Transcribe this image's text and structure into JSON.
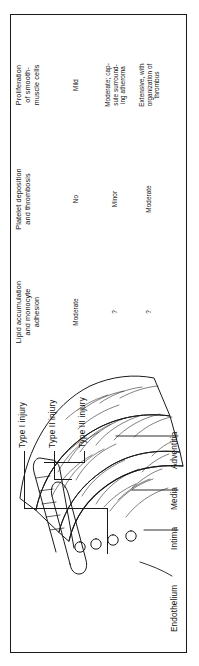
{
  "figure": {
    "title_present": false,
    "orientation": "rotated-90-ccw",
    "line_color": "#1a1a1a",
    "background": "#ffffff"
  },
  "table": {
    "columns": [
      {
        "id": "lipid",
        "header_lines": [
          "Lipid accumulation",
          "and monocyte",
          "adhesion"
        ]
      },
      {
        "id": "platelet",
        "header_lines": [
          "Platelet deposition",
          "and thrombosis"
        ]
      },
      {
        "id": "proliferation",
        "header_lines": [
          "Proliferation",
          "of smooth-",
          "muscle cells"
        ]
      }
    ],
    "rows": [
      {
        "injury": "Type I injury",
        "lipid": [
          "Moderate"
        ],
        "platelet": [
          "No"
        ],
        "proliferation": [
          "Mild"
        ]
      },
      {
        "injury": "Type II injury",
        "lipid": [
          "?"
        ],
        "platelet": [
          "Minor"
        ],
        "proliferation": [
          "Moderate; cap-",
          "sule surround-",
          "ing atheroma"
        ]
      },
      {
        "injury": "Type III injury",
        "lipid": [
          "?"
        ],
        "platelet": [
          "Moderate"
        ],
        "proliferation": [
          "Extensive, with",
          "organization of",
          "thrombus"
        ]
      }
    ]
  },
  "injury_labels": [
    "Type I injury",
    "Type II injury",
    "Type III injury"
  ],
  "anatomy_labels": [
    "Endothelium",
    "Intima",
    "Media",
    "Adventitia"
  ]
}
